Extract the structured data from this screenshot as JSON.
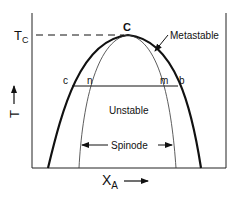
{
  "diagram": {
    "type": "phase-diagram-miscibility-gap",
    "axes": {
      "y_label": "T",
      "x_label_main": "X",
      "x_label_sub": "A",
      "tc_label_main": "T",
      "tc_label_sub": "C"
    },
    "points": {
      "critical": "C",
      "binodal_left": "c",
      "spinodal_left": "n",
      "spinodal_right": "m",
      "binodal_right": "b"
    },
    "regions": {
      "metastable": "Metastable",
      "unstable": "Unstable",
      "spinode": "Spinode"
    },
    "colors": {
      "line": "#111111",
      "background": "#ffffff"
    }
  }
}
